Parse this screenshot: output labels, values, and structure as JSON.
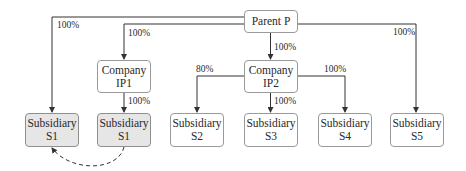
{
  "diagram": {
    "type": "ownership-structure",
    "nodes": {
      "parent": {
        "line1": "Parent P",
        "line2": ""
      },
      "ip1": {
        "line1": "Company",
        "line2": "IP1"
      },
      "ip2": {
        "line1": "Company",
        "line2": "IP2"
      },
      "s1a": {
        "line1": "Subsidiary",
        "line2": "S1",
        "highlighted": true
      },
      "s1b": {
        "line1": "Subsidiary",
        "line2": "S1",
        "highlighted": true
      },
      "s2": {
        "line1": "Subsidiary",
        "line2": "S2"
      },
      "s3": {
        "line1": "Subsidiary",
        "line2": "S3"
      },
      "s4": {
        "line1": "Subsidiary",
        "line2": "S4"
      },
      "s5": {
        "line1": "Subsidiary",
        "line2": "S5"
      }
    },
    "edges": [
      {
        "from": "Parent P",
        "to": "Subsidiary S1",
        "label": "100%"
      },
      {
        "from": "Parent P",
        "to": "Company IP1",
        "label": "100%"
      },
      {
        "from": "Parent P",
        "to": "Company IP2",
        "label": "100%"
      },
      {
        "from": "Parent P",
        "to": "Subsidiary S5",
        "label": "100%"
      },
      {
        "from": "Company IP1",
        "to": "Subsidiary S1",
        "label": "100%"
      },
      {
        "from": "Company IP2",
        "to": "Subsidiary S2",
        "label": "80%"
      },
      {
        "from": "Company IP2",
        "to": "Subsidiary S3",
        "label": "100%"
      },
      {
        "from": "Company IP2",
        "to": "Subsidiary S4",
        "label": "100%"
      },
      {
        "from": "Subsidiary S1 (via IP1)",
        "to": "Subsidiary S1 (direct)",
        "label": "",
        "style": "dashed-curve"
      }
    ],
    "labels": {
      "p_s1": "100%",
      "p_ip1": "100%",
      "p_ip2": "100%",
      "p_s5": "100%",
      "ip1_s1": "100%",
      "ip2_s2": "80%",
      "ip2_s3": "100%",
      "ip2_s4": "100%"
    },
    "colors": {
      "line": "#333333",
      "node_border": "#9a9a9a",
      "node_fill": "#ffffff",
      "highlight_fill": "#e6e6e6"
    }
  }
}
